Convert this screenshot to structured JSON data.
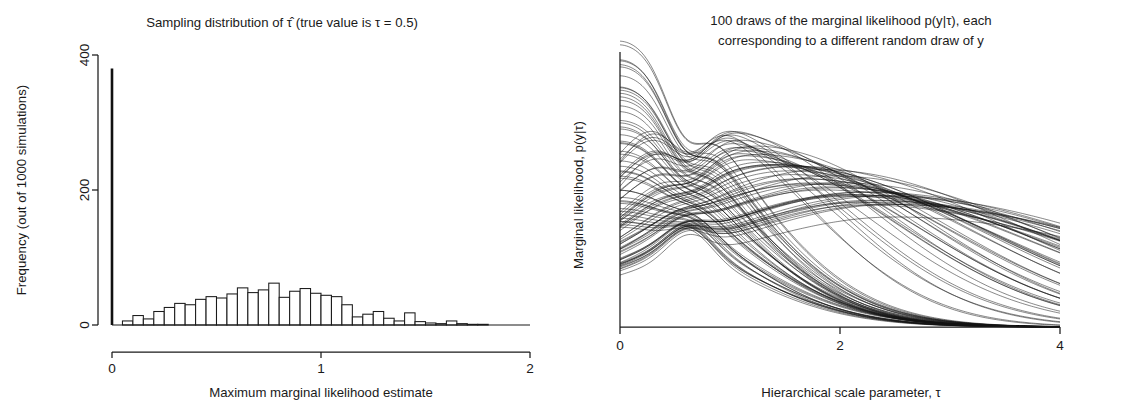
{
  "figure": {
    "background": "#ffffff",
    "ink": "#1a1a1a"
  },
  "chart_data": [
    {
      "id": "sampling-distribution",
      "type": "bar",
      "title": "Sampling distribution of τ̂  (true value is τ = 0.5)",
      "xlabel": "Maximum marginal likelihood estimate",
      "ylabel": "Frequency (out of 1000 simulations)",
      "xlim": [
        0,
        2
      ],
      "ylim": [
        0,
        430
      ],
      "xticks": [
        0,
        1,
        2
      ],
      "xticklabels": [
        "0",
        "1",
        "2"
      ],
      "yticks": [
        0,
        200,
        400
      ],
      "yticklabels": [
        "0",
        "200",
        "400"
      ],
      "grid": false,
      "legend": null,
      "bin_width": 0.05,
      "spike": {
        "x": 0.0,
        "value": 380,
        "note": "point mass of estimates at tau-hat = 0"
      },
      "bin_starts": [
        0.05,
        0.1,
        0.15,
        0.2,
        0.25,
        0.3,
        0.35,
        0.4,
        0.45,
        0.5,
        0.55,
        0.6,
        0.65,
        0.7,
        0.75,
        0.8,
        0.85,
        0.9,
        0.95,
        1.0,
        1.05,
        1.1,
        1.15,
        1.2,
        1.25,
        1.3,
        1.35,
        1.4,
        1.45,
        1.5,
        1.55,
        1.6,
        1.65,
        1.7,
        1.75,
        1.8,
        1.85,
        1.9,
        1.95
      ],
      "values": [
        6,
        14,
        9,
        20,
        26,
        32,
        30,
        38,
        42,
        40,
        46,
        55,
        48,
        52,
        62,
        41,
        50,
        54,
        47,
        44,
        42,
        30,
        12,
        16,
        20,
        10,
        6,
        18,
        5,
        3,
        2,
        6,
        2,
        1,
        1,
        0,
        0,
        0,
        0
      ]
    },
    {
      "id": "marginal-likelihood-draws",
      "type": "line",
      "title_lines": [
        "100 draws of the marginal likelihood p(y|τ), each",
        "corresponding to a different random draw of y"
      ],
      "xlabel": "Hierarchical scale parameter, τ",
      "ylabel": "Marginal likelihood, p(y|τ)",
      "xlim": [
        0,
        4
      ],
      "ylim": [
        0,
        1
      ],
      "xticks": [
        0,
        2,
        4
      ],
      "xticklabels": [
        "0",
        "2",
        "4"
      ],
      "yticks": [],
      "yticklabels": [],
      "grid": false,
      "legend": null,
      "n_curves": 100,
      "crossing_point": {
        "x": 0.62,
        "y": 0.45,
        "note": "curves pinch together near tau = 0.6"
      },
      "description": "Spaghetti plot: about half the curves decay monotonically from a maximum at tau = 0; the rest are unimodal with modes spread between tau = 0.8 and tau = 2.4, all decaying toward 0 by tau = 4."
    }
  ]
}
